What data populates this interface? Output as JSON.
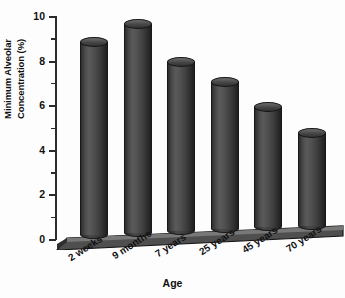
{
  "chart_data": {
    "type": "bar",
    "title": "",
    "categories": [
      "2 weeks",
      "9 months",
      "7 years",
      "25 years",
      "45 years",
      "70 years"
    ],
    "values": [
      9.2,
      10.0,
      8.3,
      7.4,
      6.3,
      5.1
    ],
    "xlabel": "Age",
    "ylabel_line1": "Minimum Alveolar",
    "ylabel_line2": "Concentration (%)",
    "ylim": [
      0,
      10
    ],
    "ytick_labels": [
      "0",
      "2",
      "4",
      "6",
      "8",
      "10"
    ],
    "ytick_values": [
      0,
      2,
      4,
      6,
      8,
      10
    ],
    "yminor_values": [
      1,
      3,
      5,
      7,
      9
    ],
    "grid": false,
    "legend": "none",
    "style": "3d-cylinder",
    "colors": {
      "bar": "#4a4a4a",
      "bar_dark": "#1d1d1d",
      "bar_light": "#6d6d6d",
      "axis": "#2b2b2b",
      "floor": "#5b5b5b",
      "text": "#111111",
      "background": "#fdfdfd"
    }
  }
}
